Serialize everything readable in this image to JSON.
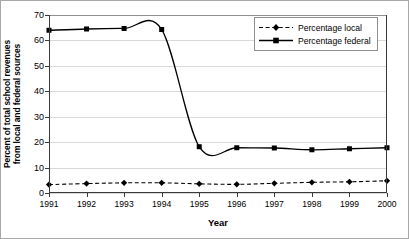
{
  "chart_data": {
    "type": "line",
    "title": "",
    "xlabel": "Year",
    "ylabel": "Percent of total school revenues from local and federal sources",
    "ylabel_lines": [
      "Percent of total school revenues",
      "from local and federal sources"
    ],
    "categories": [
      "1991",
      "1992",
      "1993",
      "1994",
      "1995",
      "1996",
      "1997",
      "1998",
      "1999",
      "2000"
    ],
    "x": [
      1991,
      1992,
      1993,
      1994,
      1995,
      1996,
      1997,
      1998,
      1999,
      2000
    ],
    "xlim": [
      1991,
      2000
    ],
    "ylim": [
      0,
      70
    ],
    "yticks": [
      0,
      10,
      20,
      30,
      40,
      50,
      60,
      70
    ],
    "ytick_labels": [
      "0",
      "10",
      "20",
      "30",
      "40",
      "50",
      "60",
      "70"
    ],
    "grid": true,
    "legend_position": "top-right",
    "series": [
      {
        "name": "Percentage local",
        "values": [
          3.3,
          3.7,
          4.0,
          4.0,
          3.6,
          3.4,
          3.8,
          4.2,
          4.4,
          4.8
        ],
        "line_style": "dashed",
        "marker": "diamond",
        "color": "#000000"
      },
      {
        "name": "Percentage federal",
        "values": [
          64.0,
          64.5,
          64.7,
          64.3,
          18.2,
          17.8,
          17.7,
          17.0,
          17.4,
          17.8
        ],
        "line_style": "solid",
        "marker": "square",
        "color": "#000000"
      }
    ]
  },
  "legend": {
    "items": [
      {
        "label": "Percentage local"
      },
      {
        "label": "Percentage federal"
      }
    ]
  },
  "axes": {
    "x_title": "Year",
    "y_title_line1": "Percent of total school revenues",
    "y_title_line2": "from local and federal sources"
  },
  "colors": {
    "line": "#000000",
    "grid": "#d9d9d9",
    "axis": "#3a3a3a",
    "frame": "#a8a8a8",
    "background": "#ffffff"
  }
}
